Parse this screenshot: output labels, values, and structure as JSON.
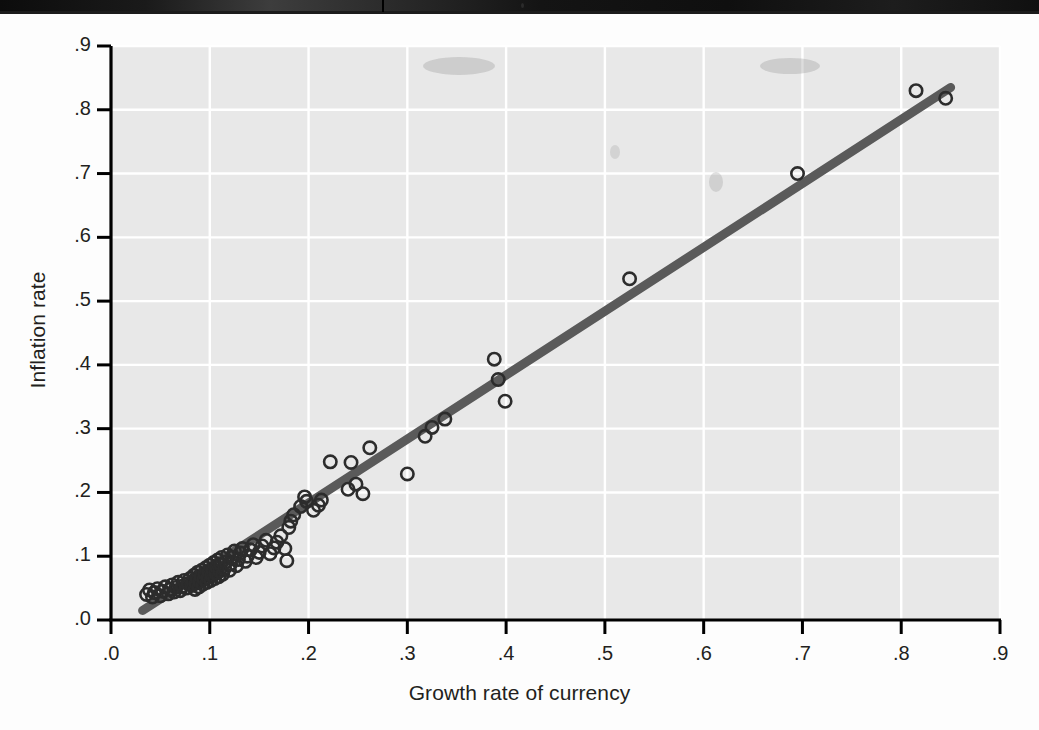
{
  "figure": {
    "kind": "scatter-plot-figure",
    "background_color": "#fdfdfd",
    "plot_background_color": "#e8e8e8",
    "gridline_color": "#ffffff",
    "axis_color": "#000000",
    "marker_color": "#2c2c2c",
    "regression_line_color": "#5a5a5a"
  },
  "chart_data": {
    "type": "scatter",
    "title": "",
    "xlabel": "Growth rate of currency",
    "ylabel": "Inflation rate",
    "xlim": [
      0.0,
      0.9
    ],
    "ylim": [
      0.0,
      0.9
    ],
    "xticks": [
      0.0,
      0.1,
      0.2,
      0.3,
      0.4,
      0.5,
      0.6,
      0.7,
      0.8,
      0.9
    ],
    "yticks": [
      0.0,
      0.1,
      0.2,
      0.3,
      0.4,
      0.5,
      0.6,
      0.7,
      0.8,
      0.9
    ],
    "xticklabels": [
      ".0",
      ".1",
      ".2",
      ".3",
      ".4",
      ".5",
      ".6",
      ".7",
      ".8",
      ".9"
    ],
    "yticklabels": [
      ".0",
      ".1",
      ".2",
      ".3",
      ".4",
      ".5",
      ".6",
      ".7",
      ".8",
      ".9"
    ],
    "grid": true,
    "legend": null,
    "marker": "open-circle",
    "series": [
      {
        "name": "Countries",
        "points": [
          [
            0.036,
            0.04
          ],
          [
            0.039,
            0.047
          ],
          [
            0.042,
            0.036
          ],
          [
            0.044,
            0.043
          ],
          [
            0.047,
            0.049
          ],
          [
            0.05,
            0.038
          ],
          [
            0.052,
            0.045
          ],
          [
            0.055,
            0.052
          ],
          [
            0.058,
            0.041
          ],
          [
            0.06,
            0.048
          ],
          [
            0.062,
            0.055
          ],
          [
            0.064,
            0.044
          ],
          [
            0.066,
            0.051
          ],
          [
            0.068,
            0.059
          ],
          [
            0.07,
            0.046
          ],
          [
            0.072,
            0.053
          ],
          [
            0.074,
            0.062
          ],
          [
            0.076,
            0.05
          ],
          [
            0.078,
            0.057
          ],
          [
            0.08,
            0.065
          ],
          [
            0.082,
            0.054
          ],
          [
            0.083,
            0.061
          ],
          [
            0.084,
            0.07
          ],
          [
            0.085,
            0.048
          ],
          [
            0.086,
            0.058
          ],
          [
            0.087,
            0.066
          ],
          [
            0.088,
            0.075
          ],
          [
            0.089,
            0.052
          ],
          [
            0.09,
            0.06
          ],
          [
            0.091,
            0.068
          ],
          [
            0.092,
            0.078
          ],
          [
            0.093,
            0.056
          ],
          [
            0.094,
            0.064
          ],
          [
            0.095,
            0.072
          ],
          [
            0.096,
            0.082
          ],
          [
            0.097,
            0.059
          ],
          [
            0.098,
            0.067
          ],
          [
            0.099,
            0.076
          ],
          [
            0.1,
            0.086
          ],
          [
            0.101,
            0.062
          ],
          [
            0.102,
            0.07
          ],
          [
            0.103,
            0.079
          ],
          [
            0.104,
            0.09
          ],
          [
            0.105,
            0.065
          ],
          [
            0.106,
            0.074
          ],
          [
            0.107,
            0.083
          ],
          [
            0.108,
            0.094
          ],
          [
            0.109,
            0.068
          ],
          [
            0.11,
            0.077
          ],
          [
            0.111,
            0.087
          ],
          [
            0.112,
            0.098
          ],
          [
            0.113,
            0.072
          ],
          [
            0.115,
            0.081
          ],
          [
            0.116,
            0.091
          ],
          [
            0.118,
            0.102
          ],
          [
            0.12,
            0.078
          ],
          [
            0.121,
            0.088
          ],
          [
            0.123,
            0.098
          ],
          [
            0.125,
            0.108
          ],
          [
            0.127,
            0.085
          ],
          [
            0.129,
            0.095
          ],
          [
            0.131,
            0.105
          ],
          [
            0.133,
            0.112
          ],
          [
            0.136,
            0.092
          ],
          [
            0.138,
            0.1
          ],
          [
            0.141,
            0.11
          ],
          [
            0.144,
            0.118
          ],
          [
            0.147,
            0.098
          ],
          [
            0.15,
            0.106
          ],
          [
            0.153,
            0.116
          ],
          [
            0.157,
            0.125
          ],
          [
            0.161,
            0.104
          ],
          [
            0.165,
            0.113
          ],
          [
            0.168,
            0.122
          ],
          [
            0.172,
            0.132
          ],
          [
            0.176,
            0.112
          ],
          [
            0.178,
            0.093
          ],
          [
            0.18,
            0.145
          ],
          [
            0.182,
            0.155
          ],
          [
            0.185,
            0.165
          ],
          [
            0.192,
            0.178
          ],
          [
            0.196,
            0.193
          ],
          [
            0.198,
            0.186
          ],
          [
            0.205,
            0.172
          ],
          [
            0.21,
            0.18
          ],
          [
            0.213,
            0.188
          ],
          [
            0.222,
            0.248
          ],
          [
            0.24,
            0.205
          ],
          [
            0.243,
            0.247
          ],
          [
            0.248,
            0.213
          ],
          [
            0.255,
            0.198
          ],
          [
            0.262,
            0.27
          ],
          [
            0.3,
            0.229
          ],
          [
            0.318,
            0.288
          ],
          [
            0.325,
            0.302
          ],
          [
            0.338,
            0.315
          ],
          [
            0.388,
            0.409
          ],
          [
            0.392,
            0.377
          ],
          [
            0.399,
            0.343
          ],
          [
            0.525,
            0.535
          ],
          [
            0.695,
            0.7
          ],
          [
            0.815,
            0.83
          ],
          [
            0.845,
            0.818
          ]
        ]
      }
    ],
    "trendline": {
      "name": "fitted regression line",
      "x_start": 0.032,
      "y_start": 0.015,
      "x_end": 0.85,
      "y_end": 0.835,
      "slope": 1.002,
      "intercept": -0.017
    }
  }
}
